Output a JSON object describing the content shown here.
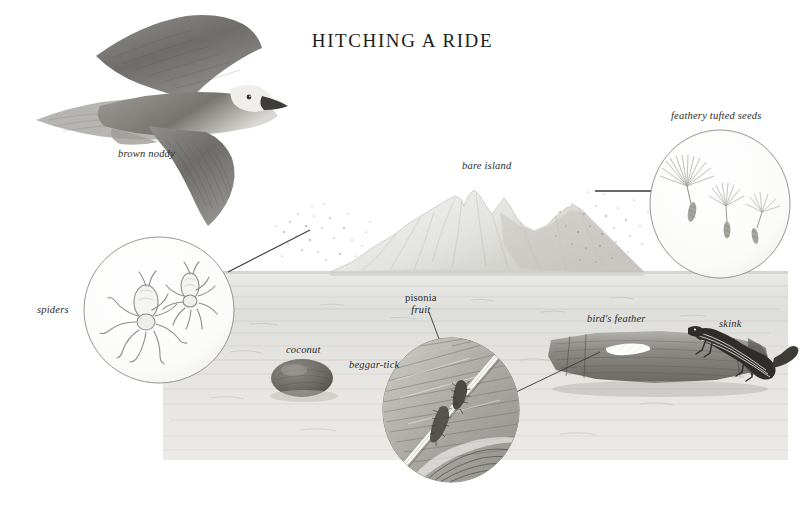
{
  "plate": {
    "title": "HITCHING A RIDE",
    "medium": "graphite pencil illustration",
    "background_color": "#ffffff",
    "ink_color": "#2b2b2b"
  },
  "labels": [
    {
      "id": "brown-noddy",
      "text": "brown noddy",
      "x": 118,
      "y": 148,
      "style": "italic"
    },
    {
      "id": "bare-island",
      "text": "bare island",
      "x": 462,
      "y": 160,
      "style": "italic"
    },
    {
      "id": "feathery-seeds",
      "text": "feathery tufted seeds",
      "x": 671,
      "y": 110,
      "style": "italic"
    },
    {
      "id": "spiders",
      "text": "spiders",
      "x": 37,
      "y": 304,
      "style": "italic"
    },
    {
      "id": "coconut",
      "text": "coconut",
      "x": 286,
      "y": 344,
      "style": "italic"
    },
    {
      "id": "beggar-tick",
      "text": "beggar-tick",
      "x": 349,
      "y": 359,
      "style": "italic"
    },
    {
      "id": "birds-feather",
      "text": "bird's feather",
      "x": 587,
      "y": 313,
      "style": "italic"
    },
    {
      "id": "skink",
      "text": "skink",
      "x": 719,
      "y": 318,
      "style": "italic"
    }
  ],
  "pisonia_label": {
    "line1": "pisonia",
    "line2": "fruit",
    "x": 405,
    "y": 292
  },
  "subjects": [
    {
      "name": "brown noddy",
      "kind": "seabird in flight",
      "detail": "pale crown, dark wings, forked tail"
    },
    {
      "name": "bare island",
      "kind": "volcanic island",
      "detail": "ridged peak rising from the sea"
    },
    {
      "name": "spiders",
      "kind": "ballooning spiders",
      "detail": "two spiders in magnifier circle"
    },
    {
      "name": "feathery tufted seeds",
      "kind": "wind-borne seeds",
      "detail": "three pappus seeds in magnifier circle"
    },
    {
      "name": "coconut",
      "kind": "floating drift seed",
      "detail": "rounded husk afloat"
    },
    {
      "name": "pisonia fruit",
      "kind": "sticky burr seed",
      "detail": "clinging to a feather"
    },
    {
      "name": "beggar-tick",
      "kind": "barbed burr seed",
      "detail": "clinging to a feather"
    },
    {
      "name": "bird's feather",
      "kind": "feather on driftwood",
      "detail": "white feather resting on log"
    },
    {
      "name": "skink",
      "kind": "lizard rafting",
      "detail": "striped skink on driftwood log"
    }
  ],
  "leader_lines": [
    {
      "id": "spiders-to-cloud",
      "from": "spiders-circle",
      "to": "dot-cloud-left"
    },
    {
      "id": "seeds-to-cloud",
      "from": "seeds-circle",
      "to": "dot-cloud-right"
    },
    {
      "id": "pisonia-to-burr",
      "from": "pisonia-label",
      "to": "burr-upper"
    },
    {
      "id": "beggartick-to-burr",
      "from": "beggar-tick-label",
      "to": "burr-lower"
    },
    {
      "id": "feather-to-circle",
      "from": "feather-on-log",
      "to": "feather-circle"
    }
  ]
}
